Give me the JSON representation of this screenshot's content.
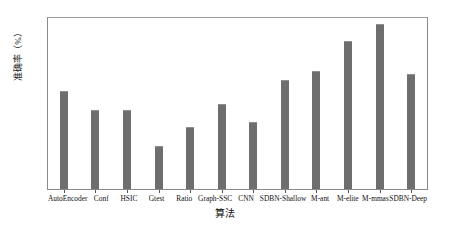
{
  "chart_data": {
    "type": "bar",
    "title": "",
    "xlabel": "算法",
    "ylabel": "准确率（%）",
    "ylim": [
      40,
      80
    ],
    "yticks": [
      40,
      45,
      50,
      55,
      60,
      65,
      70,
      75,
      80
    ],
    "ytick_labels": [
      "40",
      "45",
      "50",
      "55",
      "60",
      "65",
      "70",
      "75",
      "80"
    ],
    "grid": false,
    "legend": "none",
    "bar_color": "#6e6e6e",
    "categories": [
      "AutoEncoder",
      "Conf",
      "HSIC",
      "Gtest",
      "Ratio",
      "Graph-SSC",
      "CNN",
      "SDBN-Shallow",
      "M-ant",
      "M-elite",
      "M-mmas",
      "SDBN-Deep"
    ],
    "values": [
      63.0,
      58.5,
      58.5,
      50.0,
      54.5,
      60.0,
      55.6,
      65.6,
      67.7,
      74.6,
      78.5,
      67.0
    ]
  }
}
